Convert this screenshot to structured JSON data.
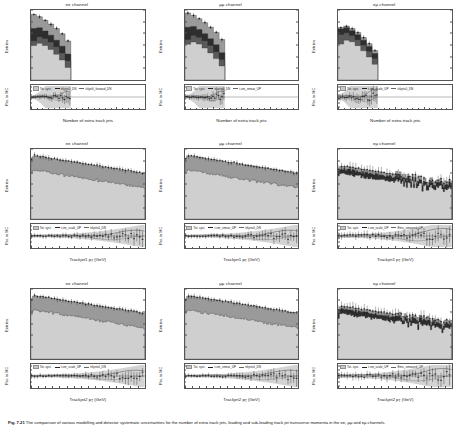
{
  "figure": {
    "caption_label": "Fig. 7.21",
    "caption_text": "The comparison of various modelling and detector systematic uncertainties for the number of extra track jets, leading and sub-leading track jet transverse momenta in the ee, μμ and eμ channels."
  },
  "axes": {
    "y_main_label": "Entries",
    "y_ratio_label": "Rat. to MC",
    "y_main_ticks": [
      "10",
      "10",
      "10",
      "10",
      "10",
      "10"
    ],
    "y_main_exponents": [
      "1",
      "2",
      "3",
      "4",
      "5",
      "6"
    ],
    "y_ratio_ticks": [
      "0.6",
      "0.8",
      "1",
      "1.2",
      "1.4",
      "1.6"
    ],
    "y_ratio_ticks_wide": [
      "0.5",
      "1",
      "1.5",
      "2",
      "2.5",
      "3"
    ]
  },
  "channels": [
    {
      "id": "ee",
      "title": "ee channel"
    },
    {
      "id": "mumu",
      "title": "μμ channel"
    },
    {
      "id": "emu",
      "title": "eμ channel"
    }
  ],
  "legend": {
    "syst_label": "Tot. syst.",
    "entries_njet": [
      [
        "trkjets0_DN",
        "trkjet0_forward_DN"
      ],
      [
        "trkjets0_DN",
        "t-sm_smear_UP"
      ],
      [
        "t-sm_scale_UP",
        "trkjets0_DN"
      ]
    ],
    "entries_pt1": [
      [
        "t-sm_scale_UP",
        "trkjets0_DN"
      ],
      [
        "t-sm_smear_UP",
        "trkjets0_DN"
      ],
      [
        "t-sm_scale_UP",
        "Emu_smeared_UP"
      ]
    ],
    "entries_pt2": [
      [
        "t-sm_scale_UP",
        "trkjets0_DN"
      ],
      [
        "t-sm_smear_UP",
        "trkjets0_DN"
      ],
      [
        "t-sm_scale_UP",
        "Emu_smeared_UP"
      ]
    ]
  },
  "chart_data": [
    {
      "id": "njets-ee",
      "type": "bar",
      "title": "ee channel",
      "xlabel": "Number of extra track jets",
      "ylabel": "Entries",
      "yscale": "log",
      "xlim": [
        0,
        20
      ],
      "ylim": [
        1,
        1000000
      ],
      "xticks": [
        0,
        5,
        10,
        15,
        20
      ],
      "categories": [
        0,
        1,
        2,
        3,
        4,
        5,
        6
      ],
      "series": [
        {
          "name": "total",
          "values": [
            420000,
            260000,
            130000,
            62000,
            26000,
            9000,
            2200
          ]
        },
        {
          "name": "mid",
          "values": [
            26000,
            30000,
            16000,
            7000,
            2600,
            800,
            170
          ]
        },
        {
          "name": "small",
          "values": [
            2300,
            5200,
            3600,
            1800,
            700,
            210,
            45
          ]
        },
        {
          "name": "light",
          "values": [
            900,
            1400,
            900,
            420,
            160,
            52,
            12
          ]
        }
      ],
      "ratio": {
        "ylim": [
          0.5,
          1.6
        ],
        "reference": 1.0
      }
    },
    {
      "id": "njets-mumu",
      "type": "bar",
      "title": "μμ channel",
      "xlabel": "Number of extra track jets",
      "ylabel": "Entries",
      "yscale": "log",
      "xlim": [
        0,
        20
      ],
      "ylim": [
        1,
        1000000
      ],
      "xticks": [
        0,
        5,
        10,
        15,
        20
      ],
      "categories": [
        0,
        1,
        2,
        3,
        4,
        5,
        6
      ],
      "series": [
        {
          "name": "total",
          "values": [
            560000,
            340000,
            175000,
            82000,
            34000,
            12000,
            3000
          ]
        },
        {
          "name": "mid",
          "values": [
            34000,
            39000,
            21000,
            9200,
            3400,
            1050,
            220
          ]
        },
        {
          "name": "small",
          "values": [
            3000,
            6800,
            4700,
            2350,
            920,
            270,
            58
          ]
        },
        {
          "name": "light",
          "values": [
            1150,
            1800,
            1200,
            550,
            210,
            68,
            16
          ]
        }
      ],
      "ratio": {
        "ylim": [
          0.5,
          1.6
        ],
        "reference": 1.0
      }
    },
    {
      "id": "njets-emu",
      "type": "bar",
      "title": "eμ channel",
      "xlabel": "Number of extra track jets",
      "ylabel": "Entries",
      "yscale": "log",
      "xlim": [
        0,
        20
      ],
      "ylim": [
        1,
        1000000
      ],
      "xticks": [
        0,
        5,
        10,
        15,
        20
      ],
      "categories": [
        0,
        1,
        2,
        3,
        4,
        5,
        6
      ],
      "series": [
        {
          "name": "total",
          "values": [
            31000,
            42000,
            26000,
            12000,
            4300,
            1300,
            330
          ]
        },
        {
          "name": "mid",
          "values": [
            24000,
            30000,
            17000,
            7400,
            2600,
            760,
            185
          ]
        },
        {
          "name": "small",
          "values": [
            8000,
            11000,
            6400,
            2800,
            980,
            290,
            70
          ]
        },
        {
          "name": "light",
          "values": [
            1200,
            2600,
            1900,
            880,
            320,
            95,
            22
          ]
        }
      ],
      "ratio": {
        "ylim": [
          0.5,
          2.0
        ],
        "reference": 1.0
      }
    },
    {
      "id": "pt1-ee",
      "type": "bar",
      "title": "ee channel",
      "xlabel": "Trackjet1 p_T (GeV)",
      "ylabel": "Entries",
      "yscale": "log",
      "xlim": [
        0,
        80
      ],
      "ylim": [
        1,
        1000000
      ],
      "xticks": [
        0,
        10,
        20,
        30,
        40,
        50,
        60,
        70,
        80
      ],
      "description": "Steeply falling spectrum from ~3e5 at low pT to ~2e2 at 80 GeV",
      "ratio": {
        "ylim": [
          0.4,
          1.6
        ],
        "reference": 1.0
      }
    },
    {
      "id": "pt1-mumu",
      "type": "bar",
      "title": "μμ channel",
      "xlabel": "Trackjet1 p_T (GeV)",
      "ylabel": "Entries",
      "yscale": "log",
      "xlim": [
        0,
        80
      ],
      "ylim": [
        1,
        1000000
      ],
      "xticks": [
        0,
        10,
        20,
        30,
        40,
        50,
        60,
        70,
        80
      ],
      "description": "Steeply falling spectrum from ~4e5 at low pT to ~3e2 at 80 GeV",
      "ratio": {
        "ylim": [
          0.4,
          1.6
        ],
        "reference": 1.0
      }
    },
    {
      "id": "pt1-emu",
      "type": "bar",
      "title": "eμ channel",
      "xlabel": "Trackjet1 p_T (GeV)",
      "ylabel": "Entries",
      "yscale": "log",
      "xlim": [
        0,
        80
      ],
      "ylim": [
        1,
        100000
      ],
      "xticks": [
        0,
        10,
        20,
        30,
        40,
        50,
        60,
        70,
        80
      ],
      "description": "Falling spectrum with large statistical scatter above 45 GeV",
      "ratio": {
        "ylim": [
          0,
          3
        ],
        "reference": 1.0
      }
    },
    {
      "id": "pt2-ee",
      "type": "bar",
      "title": "ee channel",
      "xlabel": "Trackjet2 p_T (GeV)",
      "ylabel": "Entries",
      "yscale": "log",
      "xlim": [
        0,
        80
      ],
      "ylim": [
        1,
        1000000
      ],
      "xticks": [
        0,
        10,
        20,
        30,
        40,
        50,
        60,
        70,
        80
      ],
      "description": "Steeply falling spectrum, sparse above 50 GeV",
      "ratio": {
        "ylim": [
          0,
          2
        ],
        "reference": 1.0
      }
    },
    {
      "id": "pt2-mumu",
      "type": "bar",
      "title": "μμ channel",
      "xlabel": "Trackjet2 p_T (GeV)",
      "ylabel": "Entries",
      "yscale": "log",
      "xlim": [
        0,
        80
      ],
      "ylim": [
        1,
        1000000
      ],
      "xticks": [
        0,
        10,
        20,
        30,
        40,
        50,
        60,
        70,
        80
      ],
      "description": "Steeply falling spectrum, sparse above 50 GeV",
      "ratio": {
        "ylim": [
          0,
          2
        ],
        "reference": 1.0
      }
    },
    {
      "id": "pt2-emu",
      "type": "bar",
      "title": "eμ channel",
      "xlabel": "Trackjet2 p_T (GeV)",
      "ylabel": "Entries",
      "yscale": "log",
      "xlim": [
        0,
        80
      ],
      "ylim": [
        1,
        100000
      ],
      "xticks": [
        0,
        10,
        20,
        30,
        40,
        50,
        60,
        70,
        80
      ],
      "description": "Falling spectrum with large scatter above 35 GeV",
      "ratio": {
        "ylim": [
          0,
          2
        ],
        "reference": 1.0
      }
    }
  ],
  "xaxis": {
    "njets": {
      "label": "Number of extra track jets",
      "ticks": [
        "0",
        "5",
        "10",
        "15",
        "20"
      ]
    },
    "pt1": {
      "label_main": "Trackjet1 p",
      "label_sub": "T",
      "label_unit": " (GeV)",
      "ticks": [
        "0",
        "10",
        "20",
        "30",
        "40",
        "50",
        "60",
        "70",
        "80"
      ]
    },
    "pt2": {
      "label_main": "Trackjet2 p",
      "label_sub": "T",
      "label_unit": " (GeV)",
      "ticks": [
        "0",
        "10",
        "20",
        "30",
        "40",
        "50",
        "60",
        "70",
        "80"
      ]
    }
  },
  "colors": {
    "light": "#cfcfcf",
    "mid": "#9a9a9a",
    "dark": "#5a5a5a",
    "darkest": "#2e2e2e",
    "band": "#c4c4c4",
    "line": "#202020",
    "frame": "#555555"
  }
}
